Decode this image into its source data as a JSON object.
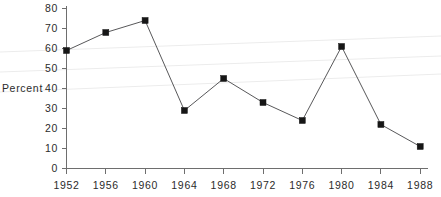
{
  "chart_data": {
    "type": "line",
    "title": "",
    "xlabel": "",
    "ylabel": "Percent",
    "categories": [
      "1952",
      "1956",
      "1960",
      "1964",
      "1968",
      "1972",
      "1976",
      "1980",
      "1984",
      "1988"
    ],
    "x": [
      1952,
      1956,
      1960,
      1964,
      1968,
      1972,
      1976,
      1980,
      1984,
      1988
    ],
    "values": [
      59,
      68,
      74,
      29,
      45,
      33,
      24,
      61,
      22,
      11
    ],
    "series": [
      {
        "name": "Percent",
        "values": [
          59,
          68,
          74,
          29,
          45,
          33,
          24,
          61,
          22,
          11
        ]
      }
    ],
    "ylim": [
      0,
      80
    ],
    "yticks": [
      0,
      10,
      20,
      30,
      40,
      50,
      60,
      70,
      80
    ],
    "ytick_labels": [
      "0",
      "10",
      "20",
      "30",
      "40",
      "50",
      "60",
      "70",
      "80"
    ],
    "xtick_labels": [
      "1952",
      "1956",
      "1960",
      "1964",
      "1968",
      "1972",
      "1976",
      "1980",
      "1984",
      "1988"
    ],
    "grid": false,
    "legend": "none",
    "marker": "square",
    "line_color": "#58585a",
    "marker_color": "#161616",
    "axis_color": "#6e6e6e"
  },
  "axes": {
    "y_axis_title": "Percent",
    "y_tick_labels": [
      "80",
      "70",
      "60",
      "50",
      "40",
      "30",
      "20",
      "10",
      "0"
    ],
    "x_tick_labels": [
      "1952",
      "1956",
      "1960",
      "1964",
      "1968",
      "1972",
      "1976",
      "1980",
      "1984",
      "1988"
    ]
  }
}
